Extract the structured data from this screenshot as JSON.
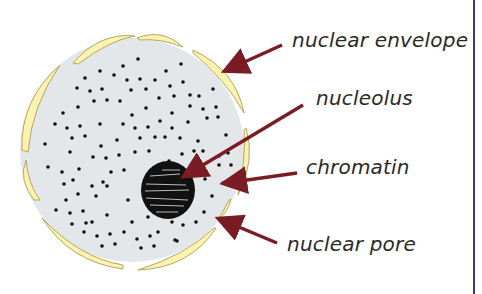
{
  "diagram": {
    "labels": {
      "nuclear_envelope": "nuclear envelope",
      "nucleolus": "nucleolus",
      "chromatin": "chromatin",
      "nuclear_pore": "nuclear pore"
    },
    "colors": {
      "nucleoplasm": "#e3e7ea",
      "envelope": "#fcf3b0",
      "envelope_stroke": "#b5a760",
      "arrow": "#7a1c24",
      "chromatin": "#111111",
      "border_line": "#3a3a7a",
      "text": "#2a2a2a"
    }
  }
}
